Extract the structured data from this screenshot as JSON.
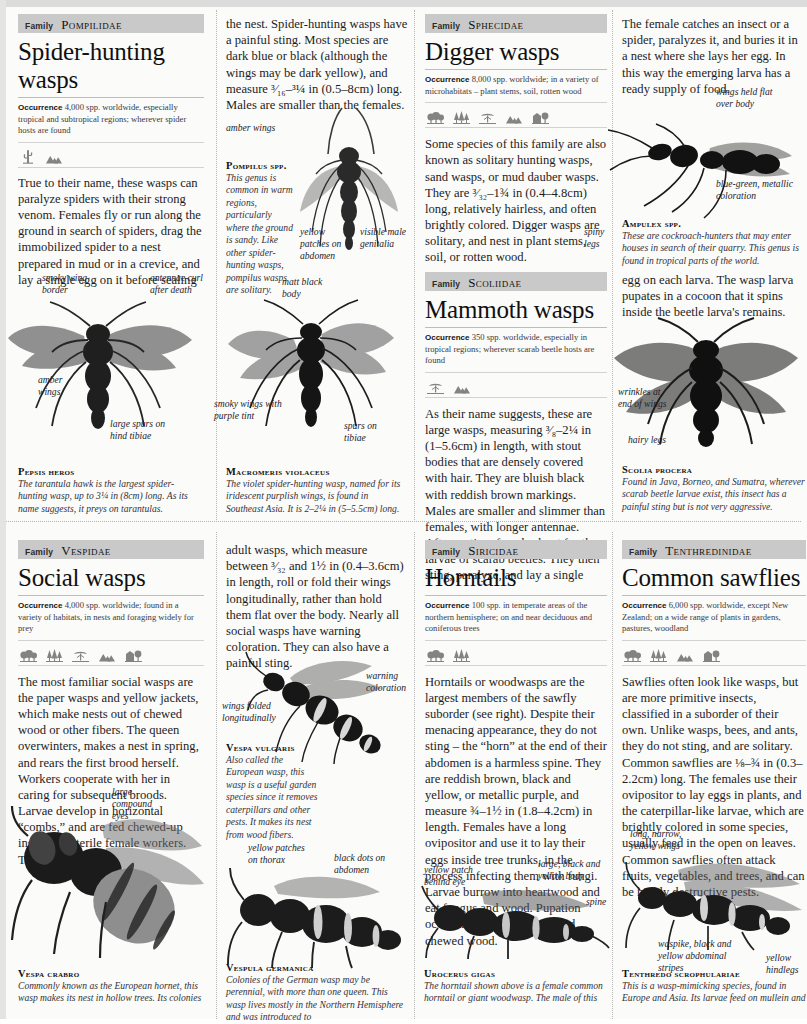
{
  "page": {
    "width": 807,
    "height": 1019,
    "background": "#fbfbfa",
    "banner_color": "#c9c9c9"
  },
  "labels": {
    "family_word": "Family",
    "occurrence_word": "Occurrence"
  },
  "entries": [
    {
      "id": "pompilidae",
      "family": "Pompilidae",
      "title": "Spider-hunting wasps",
      "occurrence": "4,000 spp. worldwide, especially tropical and subtropical regions; wherever spider hosts are found",
      "habitat_icons": [
        "desert-plant-icon",
        "mountains-icon"
      ],
      "paragraphs": [
        "True to their name, these wasps can paralyze spiders with their strong venom. Females fly or run along the ground in search of spiders, drag the immobilized spider to a nest prepared in mud or in a crevice, and lay a single egg on it before sealing",
        "the nest. Spider-hunting wasps have a painful sting. Most species are dark blue or black (although the wings may be dark yellow), and measure ³⁄₁₆–³¼ in (0.5–8cm) long. Males are smaller than the females."
      ],
      "specimens": [
        {
          "name": "Pompilus spp.",
          "desc": "This genus is common in warm regions, particularly where the ground is sandy. Like other spider-hunting wasps, pompilus wasps are solitary.",
          "annotations": [
            "amber wings",
            "yellow patches on abdomen",
            "visible male genitalia"
          ]
        },
        {
          "name": "Pepsis heros",
          "desc": "The tarantula hawk is the largest spider-hunting wasp, up to 3¼ in (8cm) long. As its name suggests, it preys on tarantulas.",
          "annotations": [
            "smoky wing border",
            "antennae curl after death",
            "amber wings",
            "large spurs on hind tibiae"
          ]
        },
        {
          "name": "Macromeris violaceus",
          "desc": "The violet spider-hunting wasp, named for its iridescent purplish wings, is found in Southeast Asia. It is 2–2¼ in (5–5.5cm) long.",
          "annotations": [
            "matt black body",
            "smoky wings with purple tint",
            "spurs on tibiae"
          ]
        }
      ]
    },
    {
      "id": "sphecidae",
      "family": "Sphecidae",
      "title": "Digger wasps",
      "occurrence": "8,000 spp. worldwide; in a variety of microhabitats – plant stems, soil, rotten wood",
      "habitat_icons": [
        "broadleaf-trees-icon",
        "conifers-icon",
        "savanna-tree-icon",
        "mountains-icon",
        "urban-icon"
      ],
      "paragraphs": [
        "Some species of this family are also known as solitary hunting wasps, sand wasps, or mud dauber wasps. They are ³⁄₃₂–1¾ in (0.4–4.8cm) long, relatively hairless, and often brightly colored. Digger wasps are solitary, and nest in plant stems, soil, or rotten wood.",
        "The female catches an insect or a spider, paralyzes it, and buries it in a nest where she lays her egg. In this way the emerging larva has a ready supply of food."
      ],
      "specimens": [
        {
          "name": "Ampulex spp.",
          "desc": "These are cockroach-hunters that may enter houses in search of their quarry. This genus is found in tropical parts of the world.",
          "annotations": [
            "wings held flat over body",
            "spiny legs",
            "blue-green, metallic coloration"
          ]
        }
      ]
    },
    {
      "id": "scoliidae",
      "family": "Scoliidae",
      "title": "Mammoth wasps",
      "occurrence": "350 spp. worldwide, especially in tropical regions; wherever scarab beetle hosts are found",
      "habitat_icons": [
        "savanna-tree-icon",
        "mountains-icon"
      ],
      "paragraphs": [
        "As their name suggests, these are large wasps, measuring ³⁄₈–2¼ in (1–5.6cm) in length, with stout bodies that are densely covered with hair. They are bluish black with reddish brown markings. Males are smaller and slimmer than females, with longer antennae. After mating, females hunt for the larvae of scarab beetles. They then sting, paralyze, and lay a single",
        "egg on each larva. The wasp larva pupates in a cocoon that it spins inside the beetle larva's remains."
      ],
      "specimens": [
        {
          "name": "Scolia procera",
          "desc": "Found in Java, Borneo, and Sumatra, wherever scarab beetle larvae exist, this insect has a painful sting but is not very aggressive.",
          "annotations": [
            "wrinkles at end of wings",
            "hairy legs"
          ]
        }
      ]
    },
    {
      "id": "vespidae",
      "family": "Vespidae",
      "title": "Social wasps",
      "occurrence": "4,000 spp. worldwide; found in a variety of habitats, in nests and foraging widely for prey",
      "habitat_icons": [
        "broadleaf-trees-icon",
        "conifers-icon",
        "savanna-tree-icon",
        "mountains-icon",
        "urban-icon"
      ],
      "paragraphs": [
        "The most familiar social wasps are the paper wasps and yellow jackets, which make nests out of chewed wood or other fibers. The queen overwinters, makes a nest in spring, and rears the first brood herself. Workers cooperate with her in caring for subsequent broods. Larvae develop in horizontal “combs,” and are fed chewed-up insects by sterile female workers. The",
        "adult wasps, which measure between ³⁄₃₂ and 1½ in (0.4–3.6cm) in length, roll or fold their wings longitudinally, rather than hold them flat over the body. Nearly all social wasps have warning coloration. They can also have a painful sting."
      ],
      "specimens": [
        {
          "name": "Vespa vulgaris",
          "desc": "Also called the European wasp, this wasp is a useful garden species since it removes caterpillars and other pests. It makes its nest from wood fibers.",
          "annotations": [
            "warning coloration",
            "wings folded longitudinally"
          ]
        },
        {
          "name": "Vespa crabro",
          "desc": "Commonly known as the European hornet, this wasp makes its nest in hollow trees. Its colonies",
          "annotations": [
            "large compound eyes"
          ]
        },
        {
          "name": "Vespula germanica",
          "desc": "Colonies of the German wasp may be perennial, with more than one queen. This wasp lives mostly in the Northern Hemisphere and was introduced to",
          "annotations": [
            "yellow patches on thorax",
            "black dots on abdomen"
          ]
        }
      ]
    },
    {
      "id": "siricidae",
      "family": "Siricidae",
      "title": "Horntails",
      "occurrence": "100 spp. in temperate areas of the northern hemisphere; on and near deciduous and coniferous trees",
      "habitat_icons": [
        "broadleaf-trees-icon",
        "conifers-icon"
      ],
      "paragraphs": [
        "Horntails or woodwasps are the largest members of the sawfly suborder (see right). Despite their menacing appearance, they do not sting – the “horn” at the end of their abdomen is a harmless spine. They are reddish brown, black and yellow, or metallic purple, and measure ¾–1½ in (1.8–4.2cm) in length. Females have a long ovipositor and use it to lay their eggs inside tree trunks, in the process infecting them with fungi. Larvae burrow into heartwood and eat fungus and wood. Pupation occurs in a cocoon of silk and chewed wood."
      ],
      "specimens": [
        {
          "name": "Urocerus gigas",
          "desc": "The horntail shown above is a female common horntail or giant woodwasp. The male of this",
          "annotations": [
            "yellow patch behind eye",
            "large, black and yellow body",
            "spine"
          ]
        }
      ]
    },
    {
      "id": "tenthredinidae",
      "family": "Tenthredinidae",
      "title": "Common sawflies",
      "occurrence": "6,000 spp. worldwide, except New Zealand; on a wide range of plants in gardens, pastures, woodland",
      "habitat_icons": [
        "broadleaf-trees-icon",
        "conifers-icon",
        "mountains-icon",
        "urban-icon"
      ],
      "paragraphs": [
        "Sawflies often look like wasps, but are more primitive insects, classified in a suborder of their own. Unlike wasps, bees, and ants, they do not sting, and are solitary. Common sawflies are ⅛–¾ in (0.3–2.2cm) long. The females use their ovipositor to lay eggs in plants, and the caterpillar-like larvae, which are brightly colored in some species, usually feed in the open on leaves. Common sawflies often attack fruits, vegetables, and trees, and can be highly destructive pests."
      ],
      "specimens": [
        {
          "name": "Tenthredo scrophulariae",
          "desc": "This is a wasp-mimicking species, found in Europe and Asia. Its larvae feed on mullein and",
          "annotations": [
            "long, narrow, yellow wings",
            "waspike, black and yellow abdominal stripes",
            "yellow hindlegs"
          ]
        }
      ]
    }
  ]
}
